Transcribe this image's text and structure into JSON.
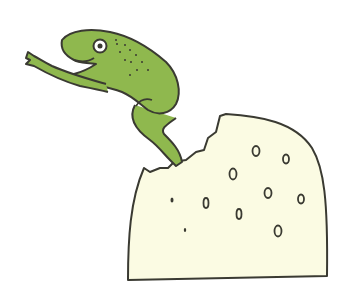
{
  "illustration": {
    "subject": "frog leaping from a block of cheese",
    "colors": {
      "background": "#ffffff",
      "frog_fill": "#8fb84e",
      "cheese_fill": "#fbfbe3",
      "outline": "#3a3a32"
    }
  }
}
